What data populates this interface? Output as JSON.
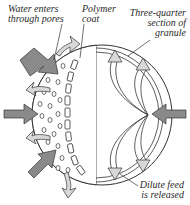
{
  "diagram": {
    "labels": {
      "water": [
        "Water enters",
        "through pores"
      ],
      "polymer": [
        "Polymer",
        "coat"
      ],
      "section": [
        "Three-quarter",
        "section of",
        "granule"
      ],
      "dilute": [
        "Dilute feed",
        "is released"
      ]
    },
    "colors": {
      "outline": "#333333",
      "inflow_arrow": "#8a8a8a",
      "outflow_arrow": "#d8d8d8",
      "background": "#ffffff"
    },
    "arrows": {
      "inflow_count": 4,
      "outflow_count": 4,
      "internal_release_count": 4
    }
  }
}
